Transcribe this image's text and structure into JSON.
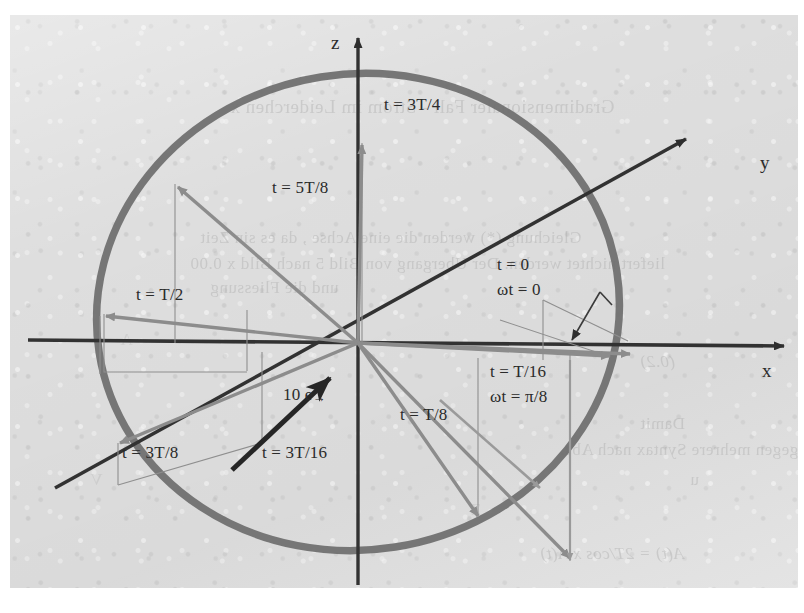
{
  "figure": {
    "type": "vector-diagram",
    "background_color": "#dedede",
    "curve_color": "#6e6e6e",
    "axis_color": "#333333",
    "vector_color": "#8a8a8a"
  },
  "axes": {
    "x_label": "x",
    "y_label": "y",
    "z_label": "z"
  },
  "vectors": [
    {
      "id": "t0",
      "label": "t = 0",
      "sub_label": "ωt = 0",
      "angle_deg": 0
    },
    {
      "id": "tT16",
      "label": "t = T/16",
      "sub_label": "ωt = π/8",
      "angle_deg": -22.5
    },
    {
      "id": "t3T16",
      "label": "t = 3T/16",
      "sub_label": "",
      "angle_deg": -67.5
    },
    {
      "id": "tT8",
      "label": "t = T/8",
      "sub_label": "",
      "angle_deg": -45
    },
    {
      "id": "t3T8",
      "label": "t = 3T/8",
      "sub_label": "",
      "angle_deg": -135
    },
    {
      "id": "tT2",
      "label": "t = T/2",
      "sub_label": "",
      "angle_deg": 180
    },
    {
      "id": "t5T8",
      "label": "t = 5T/8",
      "sub_label": "",
      "angle_deg": 135
    },
    {
      "id": "t3T4",
      "label": "t = 3T/4",
      "sub_label": "",
      "angle_deg": 90
    }
  ],
  "annotations": {
    "magnitude_label": "10 e",
    "magnitude_vector_mark": "→"
  },
  "ghost_text": {
    "lines": [
      {
        "text": "Gradimensionaler Fall - Strom im Leiderchen x",
        "x": 230,
        "y": 96,
        "cls": "ghost-head"
      },
      {
        "text": "Gleichung  (*) werden die eine Achse , da es sin Zeit",
        "x": 200,
        "y": 228,
        "cls": "ghost-body"
      },
      {
        "text": "liefert nichtet werden. Der Ubergang von Bild 5 nach Bild x 0.00",
        "x": 190,
        "y": 254,
        "cls": "ghost-body"
      },
      {
        "text": "und die Fliessung",
        "x": 210,
        "y": 278,
        "cls": "ghost-body"
      },
      {
        "text": "(0.2)",
        "x": 640,
        "y": 352,
        "cls": "ghost-eq"
      },
      {
        "text": "Damit",
        "x": 640,
        "y": 414,
        "cls": "ghost-body"
      },
      {
        "text": "gegen mehrere Syntax nach Abs.",
        "x": 560,
        "y": 440,
        "cls": "ghost-body"
      },
      {
        "text": "u",
        "x": 690,
        "y": 470,
        "cls": "ghost-body"
      },
      {
        "text": "A(t) = 2T/cos x A(t)",
        "x": 540,
        "y": 544,
        "cls": "ghost-eq"
      },
      {
        "text": "A",
        "x": 120,
        "y": 330,
        "cls": "ghost-faint ghost-body"
      },
      {
        "text": "V",
        "x": 90,
        "y": 470,
        "cls": "ghost-faint ghost-body"
      },
      {
        "text": "Z",
        "x": 470,
        "y": 500,
        "cls": "ghost-faint ghost-body"
      }
    ]
  },
  "chart_data": {
    "type": "scatter",
    "title": "",
    "xlabel": "x",
    "ylabel": "z",
    "categories": [
      "t = 0",
      "t = T/16",
      "t = T/8",
      "t = 3T/16",
      "t = 3T/8",
      "t = T/2",
      "t = 5T/8",
      "t = 3T/4"
    ],
    "values": [
      0,
      22.5,
      45,
      67.5,
      135,
      180,
      225,
      270
    ],
    "unit": "degrees of ωt",
    "radius": 10,
    "radius_label": "10 e"
  }
}
